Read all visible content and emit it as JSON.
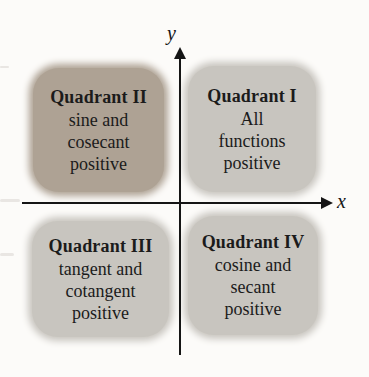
{
  "figure": {
    "axes": {
      "x_label": "x",
      "y_label": "y"
    },
    "quadrants": [
      {
        "id": "I",
        "title": "Quadrant I",
        "lines": [
          "All",
          "functions",
          "positive"
        ],
        "highlighted": false,
        "bg": "#c8c5bf"
      },
      {
        "id": "II",
        "title": "Quadrant II",
        "lines": [
          "sine and",
          "cosecant",
          "positive"
        ],
        "highlighted": true,
        "bg": "#aea294"
      },
      {
        "id": "III",
        "title": "Quadrant III",
        "lines": [
          "tangent and",
          "cotangent",
          "positive"
        ],
        "highlighted": false,
        "bg": "#c8c5bf"
      },
      {
        "id": "IV",
        "title": "Quadrant IV",
        "lines": [
          "cosine and",
          "secant",
          "positive"
        ],
        "highlighted": false,
        "bg": "#c8c5bf"
      }
    ],
    "colors": {
      "highlight_box": "#aea294",
      "box": "#c8c5bf",
      "text": "#1b1b1b",
      "axis": "#151515",
      "background": "#fcfbf9"
    }
  }
}
